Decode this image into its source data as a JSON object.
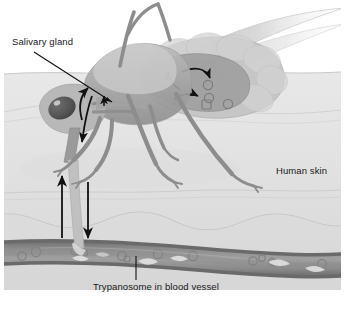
{
  "figure": {
    "type": "biology-diagram",
    "background_color": "#ffffff",
    "illustration_style": "grayscale"
  },
  "labels": {
    "salivary_gland": "Salivary gland",
    "human_skin": "Human skin",
    "trypanosome": "Trypanosome in blood vessel"
  },
  "colors": {
    "skin": "#e3e3e3",
    "skin_deep": "#dcdcdc",
    "vessel_wall": "#787878",
    "vessel_lumen": "#9a9a9a",
    "fly_body": "#a8a8a8",
    "fly_dark": "#8b8b8b",
    "fly_leg": "#909090",
    "eye": "#585858",
    "wing": "#d0d0d0",
    "leader_line": "#111111",
    "arrow": "#111111",
    "text": "#1a1a1a"
  },
  "scene": {
    "regions": [
      {
        "name": "air-above-skin",
        "description": "white area above skin surface"
      },
      {
        "name": "skin-layer",
        "description": "light gray human skin band"
      },
      {
        "name": "blood-vessel",
        "description": "horizontal gray blood vessel near bottom"
      }
    ],
    "fly": {
      "name": "tsetse-fly",
      "parts": [
        "head",
        "eye",
        "proboscis",
        "thorax",
        "abdomen",
        "gut",
        "wings",
        "legs"
      ],
      "leg_count": 6,
      "wing_count": 2
    },
    "arrows": [
      {
        "name": "gut-to-salivary-arrow-1",
        "description": "curved arrow in abdomen pointing forward"
      },
      {
        "name": "gut-to-salivary-arrow-2",
        "description": "curved arrow in abdomen pointing forward"
      },
      {
        "name": "gut-to-salivary-arrow-3",
        "description": "curved arrow in mid body"
      },
      {
        "name": "head-arrow-up",
        "description": "arrow up through head toward salivary gland"
      },
      {
        "name": "head-arrow-down",
        "description": "arrow down through proboscis"
      },
      {
        "name": "blood-intake-arrow",
        "description": "upward arrow from vessel into fly"
      },
      {
        "name": "saliva-injection-arrow",
        "description": "downward arrow into skin"
      }
    ],
    "trypanosomes_in_vessel": 11,
    "parasite_circles_in_gut": 4
  },
  "corner_mark": ""
}
